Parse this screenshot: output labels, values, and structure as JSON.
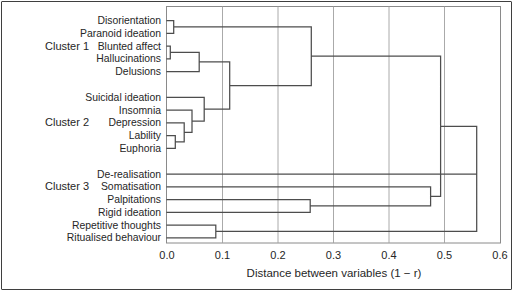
{
  "figure": {
    "kind": "dendrogram-figure",
    "background": "#ffffff"
  },
  "colors": {
    "tree_line": "#4d4d4d",
    "grid_line": "#a0a0a0",
    "plot_border": "#8a8a8a",
    "outer_border": "#3f3f3f",
    "text": "#262626",
    "background": "#ffffff"
  },
  "chart_data": {
    "type": "dendrogram",
    "orientation": "horizontal",
    "title": "",
    "xlabel": "Distance between variables (1 − r)",
    "ylabel": "",
    "xlim": [
      0.0,
      0.6
    ],
    "x_ticks": [
      0.0,
      0.1,
      0.2,
      0.3,
      0.4,
      0.5,
      0.6
    ],
    "x_tick_labels": [
      "0.0",
      "0.1",
      "0.2",
      "0.3",
      "0.4",
      "0.5",
      "0.6"
    ],
    "grid_x": [
      0.1,
      0.2,
      0.3,
      0.4,
      0.5
    ],
    "legend": "none",
    "clusters": [
      {
        "label": "Cluster 1",
        "leaves": [
          "Disorientation",
          "Paranoid ideation",
          "Blunted affect",
          "Hallucinations",
          "Delusions"
        ]
      },
      {
        "label": "Cluster 2",
        "leaves": [
          "Suicidal ideation",
          "Insomnia",
          "Depression",
          "Lability",
          "Euphoria"
        ]
      },
      {
        "label": "Cluster 3",
        "leaves": [
          "De-realisation",
          "Somatisation",
          "Palpitations",
          "Rigid ideation",
          "Repetitive thoughts",
          "Ritualised behaviour"
        ]
      }
    ],
    "merges": [
      {
        "id": "m1",
        "children": [
          "Disorientation",
          "Paranoid ideation"
        ],
        "distance": 0.012
      },
      {
        "id": "m2",
        "children": [
          "Blunted affect",
          "Hallucinations"
        ],
        "distance": 0.006
      },
      {
        "id": "m3",
        "children": [
          "m2",
          "Delusions"
        ],
        "distance": 0.058
      },
      {
        "id": "m4",
        "children": [
          "Lability",
          "Euphoria"
        ],
        "distance": 0.015
      },
      {
        "id": "m5",
        "children": [
          "Depression",
          "m4"
        ],
        "distance": 0.031
      },
      {
        "id": "m6",
        "children": [
          "Insomnia",
          "m5"
        ],
        "distance": 0.045
      },
      {
        "id": "m7",
        "children": [
          "Suicidal ideation",
          "m6"
        ],
        "distance": 0.067
      },
      {
        "id": "m8",
        "children": [
          "m3",
          "m7"
        ],
        "distance": 0.113
      },
      {
        "id": "m9",
        "children": [
          "m1",
          "m8"
        ],
        "distance": 0.26
      },
      {
        "id": "m10",
        "children": [
          "Repetitive thoughts",
          "Ritualised behaviour"
        ],
        "distance": 0.088
      },
      {
        "id": "m11",
        "children": [
          "Palpitations",
          "Rigid ideation"
        ],
        "distance": 0.258
      },
      {
        "id": "m12",
        "children": [
          "Somatisation",
          "m11"
        ],
        "distance": 0.475
      },
      {
        "id": "m13",
        "children": [
          "m9",
          "m12"
        ],
        "distance": 0.493
      },
      {
        "id": "root",
        "children": [
          "m13",
          "De-realisation",
          "m10"
        ],
        "distance": 0.558
      }
    ]
  }
}
